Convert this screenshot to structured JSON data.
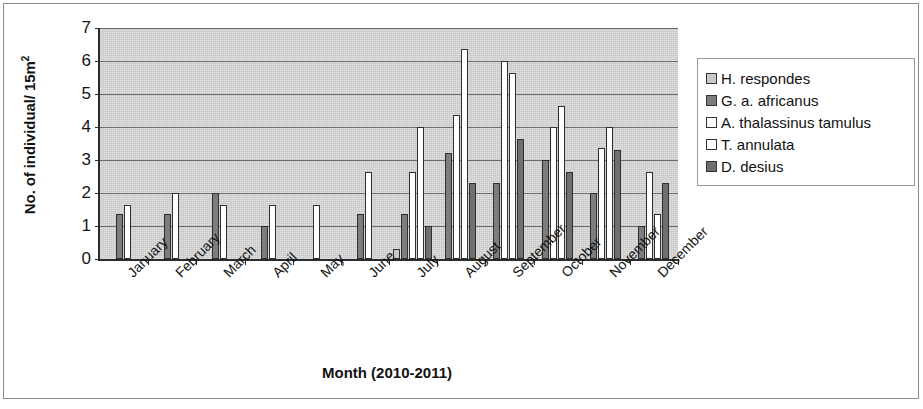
{
  "chart_data": {
    "type": "bar",
    "title": "",
    "xlabel": "Month (2010-2011)",
    "ylabel": "No. of individual/ 15m²",
    "ylabel_main": "No. of individual/ 15m",
    "ylabel_sup": "2",
    "ylim": [
      0,
      7
    ],
    "yticks": [
      0,
      1,
      2,
      3,
      4,
      5,
      6,
      7
    ],
    "ytick_labels": [
      "0",
      "1",
      "2",
      "3",
      "4",
      "5",
      "6",
      "7"
    ],
    "grid": true,
    "grid_axis": "y",
    "legend_position": "right",
    "categories": [
      "January",
      "February",
      "March",
      "April",
      "May",
      "June",
      "July",
      "August",
      "September",
      "October",
      "November",
      "December"
    ],
    "series": [
      {
        "name": "H. respondes",
        "color": "#c9c9c9",
        "values": [
          0,
          0,
          0,
          0,
          0,
          0,
          0.3,
          0,
          0,
          0,
          0,
          0
        ]
      },
      {
        "name": "G. a. africanus",
        "color": "#7d7d7d",
        "values": [
          1.35,
          1.35,
          2.0,
          1.0,
          0,
          1.35,
          1.35,
          3.2,
          2.3,
          3.0,
          2.0,
          1.0
        ]
      },
      {
        "name": "A. thalassinus tamulus",
        "color": "#ffffff",
        "values": [
          1.65,
          2.0,
          1.65,
          1.65,
          1.65,
          2.65,
          2.65,
          4.35,
          6.0,
          4.0,
          3.35,
          2.65
        ]
      },
      {
        "name": "T. annulata",
        "color": "#ffffff",
        "values": [
          0,
          0,
          0,
          0,
          0,
          0,
          4.0,
          6.35,
          5.65,
          4.65,
          4.0,
          1.35
        ]
      },
      {
        "name": "D. desius",
        "color": "#6f6f6f",
        "values": [
          0,
          0,
          0,
          0,
          0,
          0,
          1.0,
          2.3,
          3.65,
          2.65,
          3.3,
          2.3
        ]
      }
    ]
  },
  "legend": {
    "items": [
      {
        "label": "H. respondes",
        "swatch": "#c9c9c9"
      },
      {
        "label": "G. a. africanus",
        "swatch": "#7d7d7d"
      },
      {
        "label": "A. thalassinus tamulus",
        "swatch": "#ffffff"
      },
      {
        "label": "T. annulata",
        "swatch": "#ffffff"
      },
      {
        "label": "D. desius",
        "swatch": "#6f6f6f"
      }
    ]
  },
  "axes": {
    "x_title": "Month (2010-2011)",
    "y_title_main": "No. of individual/ 15m",
    "y_title_sup": "2"
  },
  "colors": {
    "plot_background": "#d4d4d4",
    "axis_line": "#2b2b2b",
    "gridline": "#6e6e6e",
    "frame": "#8a8a8a",
    "text": "#131313"
  }
}
